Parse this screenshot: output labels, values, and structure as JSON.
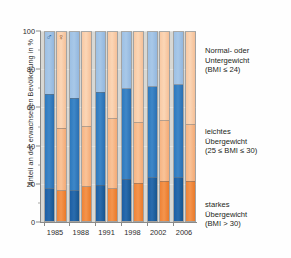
{
  "chart_data": {
    "type": "bar",
    "subtype": "stacked-percentage-grouped",
    "title": "",
    "xlabel": "",
    "ylabel": "Anteil an der erwachsenen Bevölkerung in %",
    "ylim": [
      0,
      100
    ],
    "yticks": [
      0,
      20,
      40,
      60,
      80,
      100
    ],
    "yticks_minor": [
      10,
      30,
      50,
      70,
      90
    ],
    "grid": false,
    "categories": [
      "1985",
      "1988",
      "1991",
      "1998",
      "2002",
      "2006"
    ],
    "group_symbols": {
      "male": "♂",
      "female": "♀"
    },
    "legend_position": "right",
    "series": [
      {
        "name": "Normal- oder Untergewicht (BMI ≤ 24)",
        "color_male": "#a8c8e8",
        "color_female": "#fbd6b6",
        "male_values": [
          33,
          35,
          32,
          30,
          29,
          28
        ],
        "female_values": [
          51,
          50,
          46,
          48,
          47,
          49
        ]
      },
      {
        "name": "leichtes Übergewicht (25 ≤ BMI ≤ 30)",
        "color_male": "#3e87c8",
        "color_female": "#f9c398",
        "male_values": [
          50,
          49,
          49,
          48,
          48,
          49
        ],
        "female_values": [
          33,
          32,
          37,
          32,
          32,
          30
        ]
      },
      {
        "name": "starkes Übergewicht (BMI > 30)",
        "color_male": "#2a6cae",
        "color_female": "#f4944d",
        "male_values": [
          17,
          16,
          19,
          22,
          23,
          23
        ],
        "female_values": [
          16,
          18,
          17,
          20,
          21,
          21
        ]
      }
    ]
  },
  "axis": {
    "ylabel": "Anteil an der erwachsenen Bevölkerung in %",
    "ytick_labels": [
      "100",
      "80",
      "60",
      "40",
      "20",
      "0"
    ],
    "xtick_labels": [
      "1985",
      "1988",
      "1991",
      "1998",
      "2002",
      "2006"
    ]
  },
  "legend": {
    "normal": {
      "line1": "Normal- oder",
      "line2": "Untergewicht",
      "line3": "(BMI ≤ 24)"
    },
    "overweight": {
      "line1": "leichtes",
      "line2": "Übergewicht",
      "line3": "(25 ≤ BMI ≤ 30)"
    },
    "obese": {
      "line1": "starkes",
      "line2": "Übergewicht",
      "line3": "(BMI > 30)"
    }
  },
  "symbols": {
    "male": "♂",
    "female": "♀"
  }
}
